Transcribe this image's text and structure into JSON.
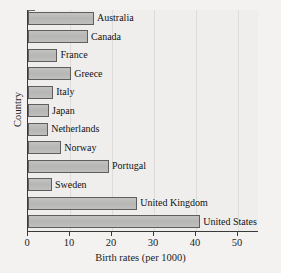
{
  "chart_data": {
    "type": "bar",
    "orientation": "horizontal",
    "title": "",
    "xlabel": "Birth rates (per 1000)",
    "ylabel": "Country",
    "categories": [
      "Australia",
      "Canada",
      "France",
      "Greece",
      "Italy",
      "Japan",
      "Netherlands",
      "Norway",
      "Portugal",
      "Sweden",
      "United Kingdom",
      "United States"
    ],
    "values": [
      15.7,
      14.3,
      7.0,
      10.3,
      6.0,
      5.0,
      4.8,
      7.9,
      19.3,
      5.7,
      26.0,
      41.0
    ],
    "xlim": [
      0,
      55
    ],
    "xticks": [
      0,
      10,
      20,
      30,
      40,
      50
    ],
    "xticklabels": [
      "0",
      "10",
      "20",
      "30",
      "40",
      "50"
    ],
    "grid": "vertical",
    "legend": "none",
    "bar_color": "#b9b9b7",
    "bar_edge_color": "#5e5e5e",
    "axis_color": "#3a3a3a",
    "background_color": "#efeeec"
  }
}
